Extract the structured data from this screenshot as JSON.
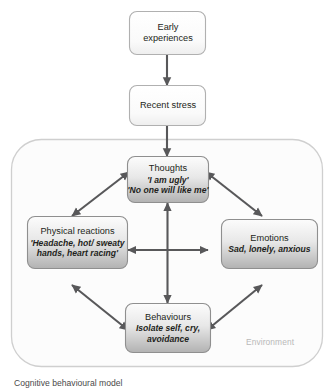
{
  "diagram": {
    "title": "Cognitive behavioural model",
    "environment_label": "Environment",
    "colors": {
      "arrow": "#58585a",
      "box_border": "#9a9a9a",
      "box_fill_top": "#fbfbfb",
      "box_fill_bottom": "#b5b5b5",
      "top_box_fill_top": "#ffffff",
      "top_box_fill_bottom": "#f2f2f2",
      "container_border": "#cfcfcf",
      "container_fill": "#fcfcfc",
      "text": "#231f20",
      "environment_text": "#b9b9b9"
    },
    "nodes": {
      "early_experiences": {
        "title_line_1": "Early",
        "title_line_2": "experiences"
      },
      "recent_stress": {
        "title": "Recent stress"
      },
      "thoughts": {
        "title": "Thoughts",
        "detail_line_1": "'I am ugly'",
        "detail_line_2": "'No one will like me'"
      },
      "physical_reactions": {
        "title": "Physical reactions",
        "detail_line_1": "'Headache, hot/ sweaty",
        "detail_line_2": "hands, heart racing'"
      },
      "emotions": {
        "title": "Emotions",
        "detail_line_1": "Sad, lonely, anxious"
      },
      "behaviours": {
        "title": "Behaviours",
        "detail_line_1": "Isolate self, cry,",
        "detail_line_2": "avoidance"
      }
    },
    "connections": [
      {
        "from": "early_experiences",
        "to": "recent_stress",
        "type": "single-arrow",
        "direction": "down"
      },
      {
        "from": "recent_stress",
        "to": "thoughts",
        "type": "single-arrow",
        "direction": "down"
      },
      {
        "from": "thoughts",
        "to": "physical_reactions",
        "type": "double-arrow",
        "direction": "diagonal"
      },
      {
        "from": "thoughts",
        "to": "emotions",
        "type": "double-arrow",
        "direction": "diagonal"
      },
      {
        "from": "physical_reactions",
        "to": "behaviours",
        "type": "double-arrow",
        "direction": "diagonal"
      },
      {
        "from": "emotions",
        "to": "behaviours",
        "type": "double-arrow",
        "direction": "diagonal"
      },
      {
        "from": "physical_reactions",
        "to": "emotions",
        "type": "double-arrow",
        "direction": "horizontal"
      },
      {
        "from": "thoughts",
        "to": "behaviours",
        "type": "double-arrow",
        "direction": "vertical"
      }
    ]
  }
}
